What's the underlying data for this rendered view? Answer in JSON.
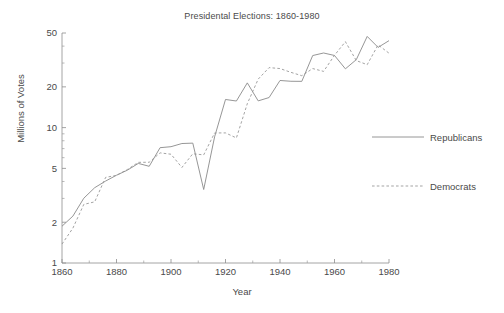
{
  "chart_data": {
    "type": "line",
    "title": "Presidental Elections: 1860-1980",
    "xlabel": "Year",
    "ylabel": "Millions of Votes",
    "yscale": "log",
    "ylim": [
      1,
      50
    ],
    "xlim": [
      1860,
      1980
    ],
    "grid": false,
    "legend_position": "right",
    "y_ticks": [
      1,
      2,
      5,
      10,
      20,
      50
    ],
    "y_tick_labels": [
      "1",
      "2",
      "5",
      "10",
      "20",
      "50"
    ],
    "x_ticks": [
      1860,
      1880,
      1900,
      1920,
      1940,
      1960,
      1980
    ],
    "x_tick_labels": [
      "1860",
      "1880",
      "1900",
      "1920",
      "1940",
      "1960",
      "1980"
    ],
    "x": [
      1860,
      1864,
      1868,
      1872,
      1876,
      1880,
      1884,
      1888,
      1892,
      1896,
      1900,
      1904,
      1908,
      1912,
      1916,
      1920,
      1924,
      1928,
      1932,
      1936,
      1940,
      1944,
      1948,
      1952,
      1956,
      1960,
      1964,
      1968,
      1972,
      1976,
      1980
    ],
    "series": [
      {
        "name": "Republicans",
        "style": "solid",
        "color": "#8a8a8a",
        "values": [
          1.87,
          2.22,
          3.01,
          3.6,
          4.03,
          4.45,
          4.85,
          5.44,
          5.18,
          7.11,
          7.23,
          7.63,
          7.68,
          3.49,
          8.55,
          16.14,
          15.72,
          21.4,
          15.76,
          16.68,
          22.3,
          22.0,
          21.97,
          34.08,
          35.59,
          34.11,
          27.18,
          31.79,
          47.17,
          39.15,
          43.9
        ]
      },
      {
        "name": "Democrats",
        "style": "dashed",
        "color": "#999999",
        "values": [
          1.38,
          1.81,
          2.71,
          2.83,
          4.29,
          4.44,
          4.91,
          5.54,
          5.55,
          6.51,
          6.36,
          5.08,
          6.41,
          6.29,
          9.13,
          9.14,
          8.39,
          15.02,
          22.82,
          27.75,
          27.31,
          25.61,
          24.18,
          27.31,
          26.03,
          34.22,
          43.13,
          31.27,
          29.17,
          40.83,
          35.48
        ]
      }
    ]
  },
  "legend": {
    "items": [
      {
        "label": "Republicans",
        "style": "solid"
      },
      {
        "label": "Democrats",
        "style": "dashed"
      }
    ]
  }
}
